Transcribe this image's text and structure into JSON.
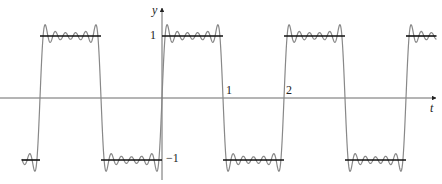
{
  "chart_data": {
    "type": "line",
    "title": "",
    "xlabel": "t",
    "ylabel": "y",
    "x_ticks": [
      {
        "value": 1,
        "label": "1"
      },
      {
        "value": 2,
        "label": "2"
      }
    ],
    "y_ticks": [
      {
        "value": 1,
        "label": "1"
      },
      {
        "value": -1,
        "label": "−1"
      }
    ],
    "xlim": [
      -2.3,
      4.5
    ],
    "ylim": [
      -1.35,
      1.25
    ],
    "grid": false,
    "legend": null,
    "series": [
      {
        "name": "square wave",
        "color": "#111111",
        "x": [
          -2.3,
          -2,
          -2,
          -1,
          -1,
          0,
          0,
          1,
          1,
          2,
          2,
          3,
          3,
          4,
          4,
          4.5
        ],
        "y": [
          -1,
          -1,
          1,
          1,
          -1,
          -1,
          1,
          1,
          -1,
          -1,
          1,
          1,
          -1,
          -1,
          1,
          1
        ]
      },
      {
        "name": "Fourier partial sum",
        "color": "#888888",
        "period": 2,
        "amplitude": 1,
        "harmonics": "odd terms n = 1,3,...,11"
      }
    ]
  },
  "labels": {
    "x_axis": "t",
    "y_axis": "y",
    "tick_1": "1",
    "tick_2": "2",
    "y_pos1": "1",
    "y_neg1": "−1"
  }
}
